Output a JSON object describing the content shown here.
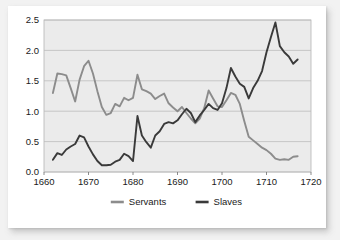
{
  "chart_data": {
    "type": "line",
    "title": "",
    "subtitle": "",
    "xlabel": "",
    "ylabel": "",
    "xlim": [
      1660,
      1720
    ],
    "ylim": [
      0.0,
      2.5
    ],
    "grid": "horizontal",
    "legend_position": "bottom",
    "xticks": [
      "1660",
      "1670",
      "1680",
      "1690",
      "1700",
      "1710",
      "1720"
    ],
    "xtick_values": [
      1660,
      1670,
      1680,
      1690,
      1700,
      1710,
      1720
    ],
    "yticks": [
      "0.0",
      "0.5",
      "1.0",
      "1.5",
      "2.0",
      "2.5"
    ],
    "ytick_values": [
      0.0,
      0.5,
      1.0,
      1.5,
      2.0,
      2.5
    ],
    "x": [
      1662,
      1663,
      1664,
      1665,
      1666,
      1667,
      1668,
      1669,
      1670,
      1671,
      1672,
      1673,
      1674,
      1675,
      1676,
      1677,
      1678,
      1679,
      1680,
      1681,
      1682,
      1683,
      1684,
      1685,
      1686,
      1687,
      1688,
      1689,
      1690,
      1691,
      1692,
      1693,
      1694,
      1695,
      1696,
      1697,
      1698,
      1699,
      1700,
      1701,
      1702,
      1703,
      1704,
      1705,
      1706,
      1707,
      1708,
      1709,
      1710,
      1711,
      1712,
      1713,
      1714,
      1715,
      1716,
      1717
    ],
    "series": [
      {
        "name": "Servants",
        "color": "#8c8c8c",
        "values": [
          1.3,
          1.62,
          1.61,
          1.59,
          1.38,
          1.16,
          1.52,
          1.74,
          1.83,
          1.62,
          1.33,
          1.07,
          0.94,
          0.97,
          1.12,
          1.08,
          1.22,
          1.18,
          1.22,
          1.6,
          1.36,
          1.33,
          1.29,
          1.2,
          1.25,
          1.29,
          1.13,
          1.06,
          1.0,
          1.07,
          0.97,
          0.88,
          0.8,
          0.88,
          1.05,
          1.34,
          1.21,
          1.08,
          1.07,
          1.18,
          1.3,
          1.27,
          1.12,
          0.84,
          0.58,
          0.52,
          0.46,
          0.4,
          0.36,
          0.3,
          0.22,
          0.2,
          0.21,
          0.2,
          0.25,
          0.26
        ]
      },
      {
        "name": "Slaves",
        "color": "#3a3a3a",
        "values": [
          0.2,
          0.31,
          0.28,
          0.37,
          0.42,
          0.46,
          0.6,
          0.57,
          0.42,
          0.29,
          0.18,
          0.11,
          0.11,
          0.12,
          0.17,
          0.2,
          0.3,
          0.26,
          0.18,
          0.92,
          0.6,
          0.49,
          0.4,
          0.6,
          0.67,
          0.79,
          0.82,
          0.8,
          0.85,
          0.95,
          1.04,
          0.97,
          0.82,
          0.93,
          1.02,
          1.12,
          1.05,
          1.02,
          1.13,
          1.38,
          1.71,
          1.57,
          1.45,
          1.4,
          1.21,
          1.38,
          1.5,
          1.66,
          1.97,
          2.22,
          2.46,
          2.07,
          1.97,
          1.9,
          1.78,
          1.85
        ]
      }
    ],
    "legend": [
      {
        "label": "Servants",
        "color": "#8c8c8c"
      },
      {
        "label": "Slaves",
        "color": "#3a3a3a"
      }
    ]
  }
}
